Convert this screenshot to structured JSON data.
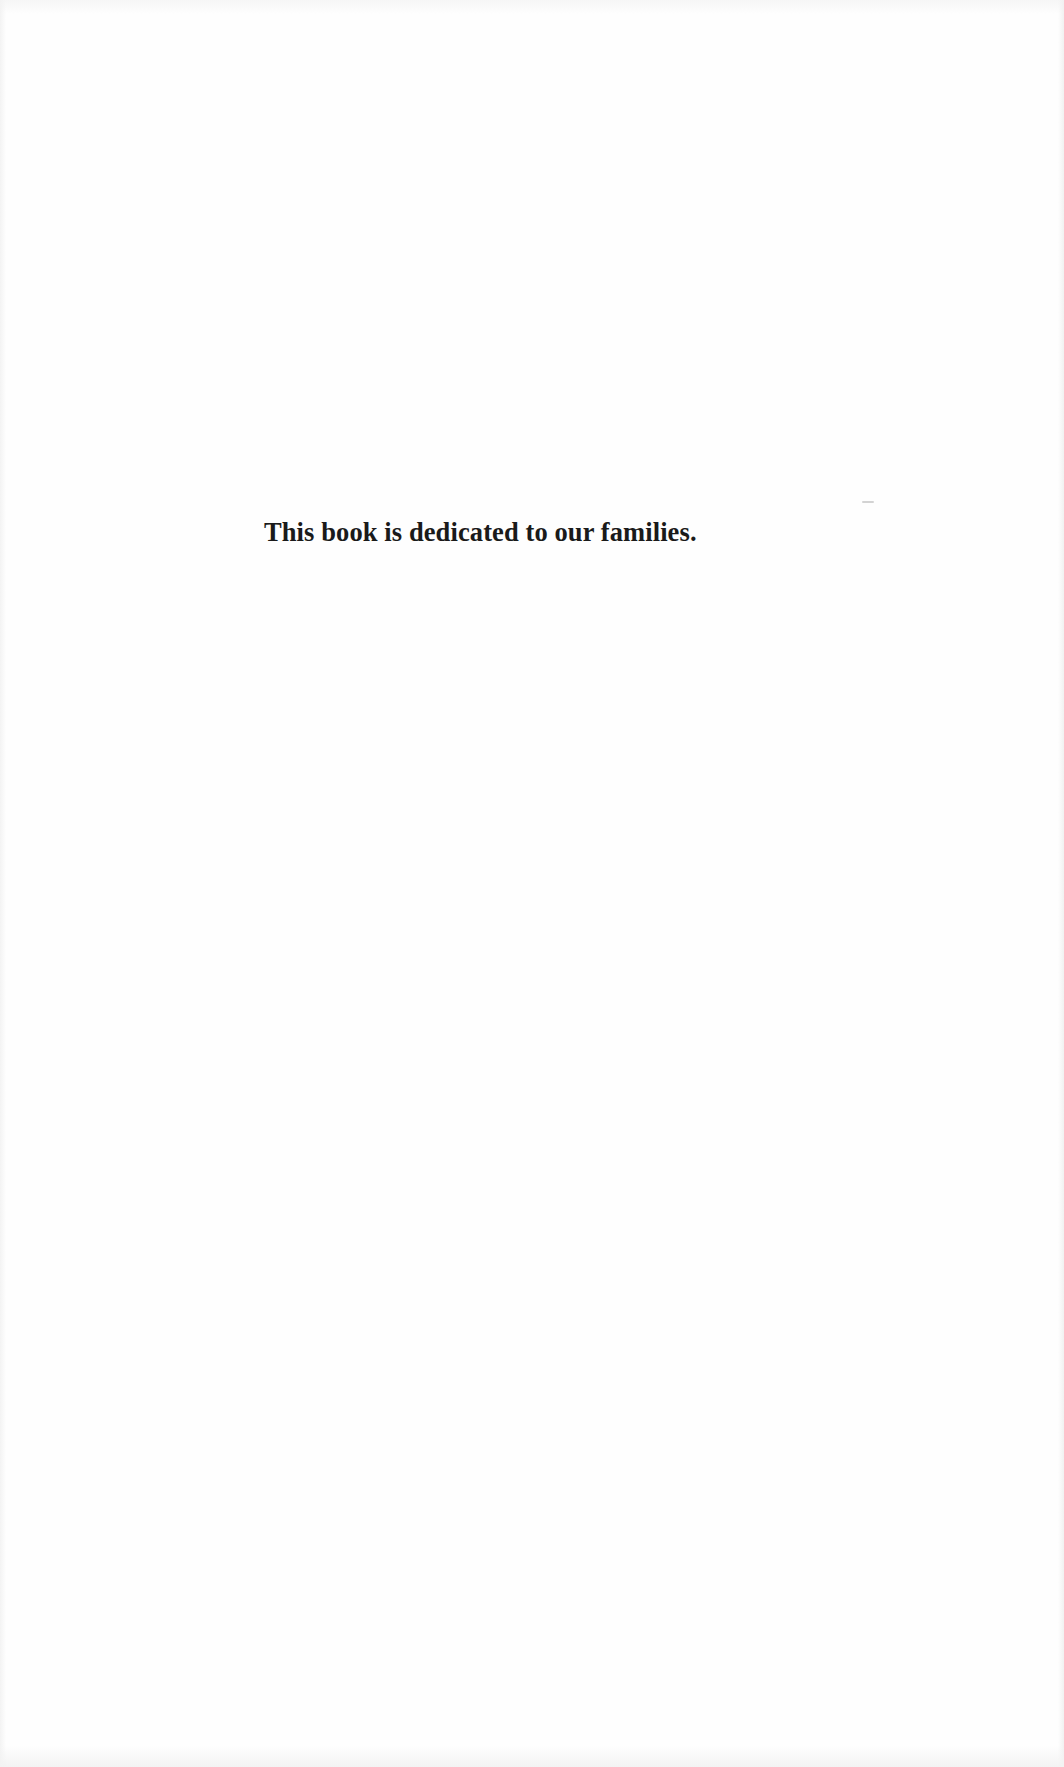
{
  "page": {
    "type": "dedication",
    "background_color": "#ffffff",
    "text_color": "#1a1a1a"
  },
  "dedication": {
    "text": "This book is dedicated to our families."
  }
}
